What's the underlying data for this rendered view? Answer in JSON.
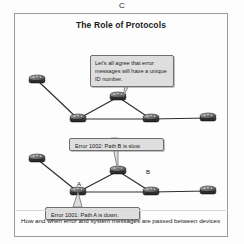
{
  "figure": {
    "letter": "C",
    "title": "The Role of Protocols",
    "caption": "How and when error and system messages are passed between devices"
  },
  "diagram_top": {
    "callout": "Let's all agree that error messages will have a unique ID number.",
    "nodes": [
      {
        "id": "n1",
        "name": "router",
        "x": 22,
        "y": 66
      },
      {
        "id": "n2",
        "name": "router",
        "x": 103,
        "y": 83
      },
      {
        "id": "n3",
        "name": "router",
        "x": 63,
        "y": 105
      },
      {
        "id": "n4",
        "name": "router",
        "x": 136,
        "y": 105
      },
      {
        "id": "n5",
        "name": "router",
        "x": 193,
        "y": 104
      }
    ],
    "links": [
      [
        "n1",
        "n3"
      ],
      [
        "n3",
        "n2"
      ],
      [
        "n2",
        "n4"
      ],
      [
        "n3",
        "n4"
      ],
      [
        "n4",
        "n5"
      ]
    ]
  },
  "diagram_bottom": {
    "callout_slow": "Error 1002: Path B is slow.",
    "callout_down": "Error 1001: Path A is down.",
    "label_a": "A",
    "label_b": "B",
    "nodes": [
      {
        "id": "m1",
        "name": "router",
        "x": 22,
        "y": 145
      },
      {
        "id": "m2",
        "name": "router",
        "x": 103,
        "y": 157
      },
      {
        "id": "m3",
        "name": "router",
        "x": 63,
        "y": 178
      },
      {
        "id": "m4",
        "name": "router",
        "x": 136,
        "y": 178
      },
      {
        "id": "m5",
        "name": "router",
        "x": 193,
        "y": 177
      }
    ],
    "links": [
      [
        "m1",
        "m3"
      ],
      [
        "m3",
        "m2"
      ],
      [
        "m2",
        "m4"
      ],
      [
        "m3",
        "m4"
      ],
      [
        "m4",
        "m5"
      ]
    ]
  },
  "colors": {
    "frame_border": "#9a9a9a",
    "callout_fill": "#dedede",
    "callout_border": "#6f6f6f",
    "link_line": "#2e2e2e",
    "router_body": "#4a4a4a",
    "page_background": "#fdfdfd",
    "text": "#1a1a1a"
  }
}
